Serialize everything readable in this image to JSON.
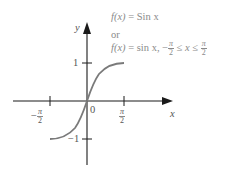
{
  "diagram": {
    "title_line1": {
      "fx": "f(x)",
      "eq": "=",
      "rhs": "Sin x"
    },
    "title_or": "or",
    "title_line2": {
      "fx": "f(x)",
      "eq": "=",
      "rhs": "sin x,",
      "cond_minus": "−",
      "le1": "≤",
      "x": "x",
      "le2": "≤"
    },
    "pi": "π",
    "two": "2",
    "axis_x_label": "x",
    "axis_y_label": "y",
    "origin_label": "0",
    "tick_y_pos": "1",
    "tick_y_neg": "−1",
    "tick_x_neg_sign": "−",
    "colors": {
      "axes": "#1a1a1a",
      "curve": "#7a7a7a",
      "text": "#8a8a8a"
    }
  }
}
